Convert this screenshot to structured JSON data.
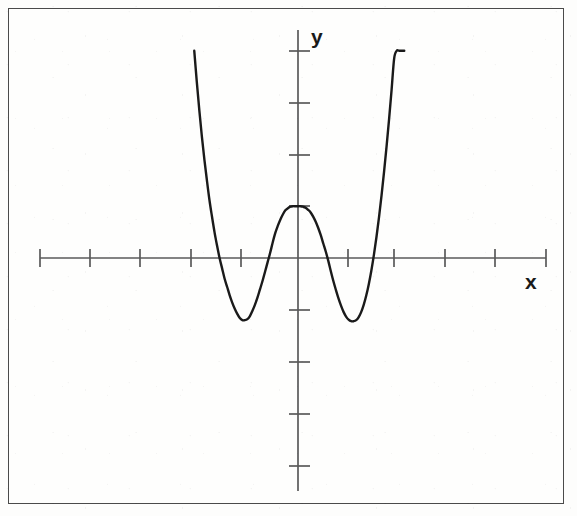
{
  "figure": {
    "kind": "cartesian-plot",
    "background_color": "#fefefd",
    "border_color": "#4a4a4a",
    "curve_color": "#1a1a1a",
    "axis_color": "#5a5a5a"
  },
  "labels": {
    "y_axis": "y",
    "x_axis": "x"
  },
  "chart_data": {
    "type": "line",
    "title": "",
    "xlabel": "x",
    "ylabel": "y",
    "grid": false,
    "legend": "none",
    "xlim": [
      -5,
      5.1
    ],
    "ylim": [
      -4.6,
      4.1
    ],
    "x_ticks": [
      -5,
      -4,
      -3,
      -2,
      -1,
      0,
      1,
      2,
      3,
      4,
      5
    ],
    "y_ticks": [
      -4,
      -3,
      -2,
      -1,
      0,
      1,
      2,
      3,
      4
    ],
    "x_tick_labels": [
      "",
      "",
      "",
      "",
      "",
      "",
      "",
      "",
      "",
      "",
      ""
    ],
    "y_tick_labels": [
      "",
      "",
      "",
      "",
      "",
      "",
      "",
      "",
      ""
    ],
    "features": {
      "local_maximum": {
        "x": 0,
        "y": 1
      },
      "local_minima": [
        {
          "x": -1.15,
          "y": -1.2
        },
        {
          "x": -1.15,
          "y": -1.2
        }
      ],
      "local_minima_points": [
        {
          "x": -1.15,
          "y": -1.2
        },
        {
          "x": 1.4,
          "y": -1.2
        }
      ],
      "x_intercepts": [
        -1.6,
        -0.45,
        0.78,
        1.88
      ],
      "y_intercept": 1
    },
    "x": [
      -2.05,
      -2.0,
      -1.95,
      -1.9,
      -1.85,
      -1.8,
      -1.75,
      -1.7,
      -1.65,
      -1.6,
      -1.55,
      -1.5,
      -1.45,
      -1.4,
      -1.35,
      -1.3,
      -1.25,
      -1.2,
      -1.15,
      -1.1,
      -1.05,
      -1.0,
      -0.95,
      -0.9,
      -0.85,
      -0.8,
      -0.75,
      -0.7,
      -0.65,
      -0.6,
      -0.55,
      -0.5,
      -0.45,
      -0.4,
      -0.35,
      -0.3,
      -0.25,
      -0.2,
      -0.15,
      -0.1,
      -0.05,
      0.0,
      0.05,
      0.1,
      0.15,
      0.2,
      0.25,
      0.3,
      0.35,
      0.4,
      0.45,
      0.5,
      0.55,
      0.6,
      0.65,
      0.7,
      0.75,
      0.8,
      0.85,
      0.9,
      0.95,
      1.0,
      1.05,
      1.1,
      1.15,
      1.2,
      1.25,
      1.3,
      1.35,
      1.4,
      1.45,
      1.5,
      1.55,
      1.6,
      1.65,
      1.7,
      1.75,
      1.8,
      1.85,
      1.9,
      1.95,
      2.0,
      2.05,
      2.1
    ],
    "y": [
      4.0,
      3.4,
      2.85,
      2.35,
      1.9,
      1.5,
      1.12,
      0.8,
      0.5,
      0.24,
      0.0,
      -0.2,
      -0.4,
      -0.56,
      -0.72,
      -0.86,
      -0.98,
      -1.08,
      -1.16,
      -1.2,
      -1.2,
      -1.18,
      -1.12,
      -1.02,
      -0.9,
      -0.76,
      -0.6,
      -0.44,
      -0.26,
      -0.08,
      0.1,
      0.3,
      0.48,
      0.62,
      0.74,
      0.84,
      0.92,
      0.96,
      0.99,
      1.0,
      1.0,
      1.0,
      1.0,
      0.99,
      0.97,
      0.93,
      0.88,
      0.8,
      0.7,
      0.58,
      0.44,
      0.28,
      0.12,
      -0.06,
      -0.26,
      -0.45,
      -0.62,
      -0.78,
      -0.92,
      -1.04,
      -1.13,
      -1.19,
      -1.22,
      -1.22,
      -1.2,
      -1.14,
      -1.04,
      -0.9,
      -0.72,
      -0.5,
      -0.24,
      0.06,
      0.4,
      0.78,
      1.2,
      1.66,
      2.15,
      2.68,
      3.25,
      3.85,
      4.0,
      4.0,
      4.0,
      4.0
    ]
  },
  "geometry": {
    "origin_px": {
      "x": 298,
      "y": 258
    },
    "x_axis_span_px": {
      "from": 40,
      "to": 546
    },
    "y_axis_span_px": {
      "from": 30,
      "to": 491
    },
    "tick_spacing_x_px": 50.6,
    "tick_spacing_y_px": 51.8
  }
}
